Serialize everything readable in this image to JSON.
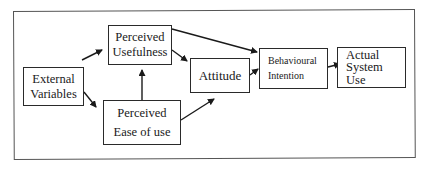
{
  "diagram": {
    "title": "",
    "nodes": [
      {
        "id": "external_variables",
        "lines": [
          "External",
          "Variables"
        ]
      },
      {
        "id": "perceived_usefulness",
        "lines": [
          "Perceived",
          "Usefulness"
        ]
      },
      {
        "id": "perceived_ease_of_use",
        "lines": [
          "Perceived",
          "Ease of use"
        ]
      },
      {
        "id": "attitude",
        "lines": [
          "Attitude"
        ]
      },
      {
        "id": "behavioural_intention",
        "lines": [
          "Behavioural",
          "Intention"
        ]
      },
      {
        "id": "actual_system_use",
        "lines": [
          "Actual",
          "System",
          "Use"
        ]
      }
    ],
    "edges": [
      {
        "from": "external_variables",
        "to": "perceived_usefulness"
      },
      {
        "from": "external_variables",
        "to": "perceived_ease_of_use"
      },
      {
        "from": "perceived_ease_of_use",
        "to": "perceived_usefulness"
      },
      {
        "from": "perceived_usefulness",
        "to": "attitude"
      },
      {
        "from": "perceived_usefulness",
        "to": "behavioural_intention"
      },
      {
        "from": "perceived_ease_of_use",
        "to": "attitude"
      },
      {
        "from": "attitude",
        "to": "behavioural_intention"
      },
      {
        "from": "behavioural_intention",
        "to": "actual_system_use"
      }
    ],
    "colors": {
      "line": "#1a1a1a",
      "frame": "#555555",
      "background": "#ffffff"
    }
  }
}
